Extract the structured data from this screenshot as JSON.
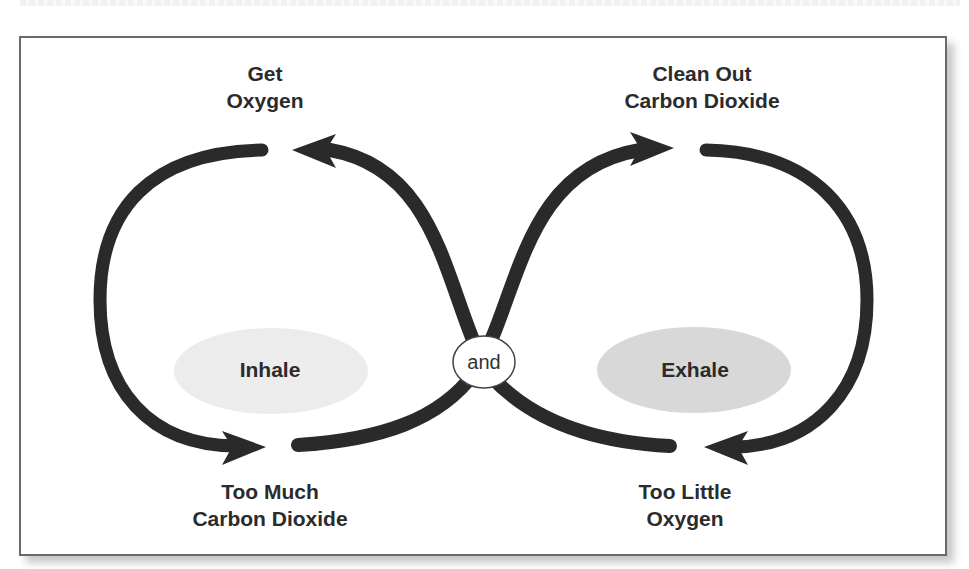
{
  "diagram": {
    "type": "cycle",
    "labels": {
      "top_left": {
        "line1": "Get",
        "line2": "Oxygen"
      },
      "top_right": {
        "line1": "Clean Out",
        "line2": "Carbon Dioxide"
      },
      "bottom_left": {
        "line1": "Too Much",
        "line2": "Carbon Dioxide"
      },
      "bottom_right": {
        "line1": "Too Little",
        "line2": "Oxygen"
      }
    },
    "ovals": {
      "left": "Inhale",
      "right": "Exhale",
      "center": "and"
    },
    "colors": {
      "arrow": "#2b2b2b",
      "left_oval": "#ededed",
      "right_oval": "#d9d9d9",
      "border": "#6a6a6a"
    }
  }
}
